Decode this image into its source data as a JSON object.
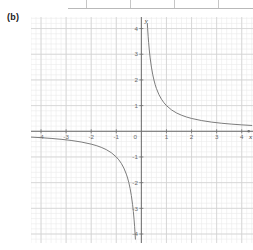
{
  "figure": {
    "label": "(b)"
  },
  "table_fragment": {
    "present": true,
    "column_divider_count": 4
  },
  "chart_data": {
    "type": "line",
    "title": "",
    "subtitle": "",
    "xlabel": "x",
    "ylabel": "y",
    "xlim": [
      -4.4,
      4.45
    ],
    "ylim": [
      -4.35,
      4.45
    ],
    "grid": true,
    "grid_major_step": 1,
    "grid_minor_per_major": 5,
    "legend": "none",
    "x_ticks": [
      -4,
      -3,
      -2,
      -1,
      0,
      1,
      2,
      3,
      4
    ],
    "x_tick_labels": [
      "-4",
      "-3",
      "-2",
      "-1",
      "0",
      "1",
      "2",
      "3",
      "4"
    ],
    "y_ticks": [
      -4,
      -3,
      -2,
      -1,
      1,
      2,
      3,
      4
    ],
    "y_tick_labels": [
      "-4",
      "-3",
      "-2",
      "-1",
      "1",
      "2",
      "3",
      "4"
    ],
    "origin_label": "0",
    "function": "y = 1/x",
    "series": [
      {
        "name": "branch-quadrant-I",
        "points_x": [
          0.238,
          0.25,
          0.27,
          0.29,
          0.32,
          0.35,
          0.4,
          0.45,
          0.5,
          0.55,
          0.6,
          0.7,
          0.8,
          0.9,
          1.0,
          1.2,
          1.4,
          1.6,
          1.8,
          2.0,
          2.4,
          2.8,
          3.2,
          3.6,
          4.0,
          4.4
        ],
        "points_y": [
          4.2,
          4.0,
          3.7,
          3.448,
          3.125,
          2.857,
          2.5,
          2.222,
          2.0,
          1.818,
          1.667,
          1.429,
          1.25,
          1.111,
          1.0,
          0.833,
          0.714,
          0.625,
          0.556,
          0.5,
          0.417,
          0.357,
          0.3125,
          0.278,
          0.25,
          0.227
        ]
      },
      {
        "name": "branch-quadrant-III",
        "points_x": [
          -4.4,
          -4.0,
          -3.6,
          -3.2,
          -2.8,
          -2.4,
          -2.0,
          -1.8,
          -1.6,
          -1.4,
          -1.2,
          -1.0,
          -0.9,
          -0.8,
          -0.7,
          -0.6,
          -0.55,
          -0.5,
          -0.45,
          -0.4,
          -0.35,
          -0.32,
          -0.29,
          -0.27,
          -0.25,
          -0.238
        ],
        "points_y": [
          -0.227,
          -0.25,
          -0.278,
          -0.3125,
          -0.357,
          -0.417,
          -0.5,
          -0.556,
          -0.625,
          -0.714,
          -0.833,
          -1.0,
          -1.111,
          -1.25,
          -1.429,
          -1.667,
          -1.818,
          -2.0,
          -2.222,
          -2.5,
          -2.857,
          -3.125,
          -3.448,
          -3.7,
          -4.0,
          -4.2
        ]
      }
    ],
    "reference_points": [
      {
        "x": 1,
        "y": 1
      },
      {
        "x": 2,
        "y": 0.5
      },
      {
        "x": -1,
        "y": -1
      },
      {
        "x": -2,
        "y": -0.5
      }
    ],
    "asymptotes": {
      "vertical": 0,
      "horizontal": 0
    },
    "colors": {
      "curve": "#6d6d6d",
      "axis": "#707070",
      "grid_major": "#d2d2d2",
      "grid_minor": "#ebebeb",
      "tick_text": "#6a6a6a",
      "axis_label_text": "#3a3a3a",
      "figure_label_text": "#1b1b1b",
      "background": "#ffffff"
    }
  }
}
